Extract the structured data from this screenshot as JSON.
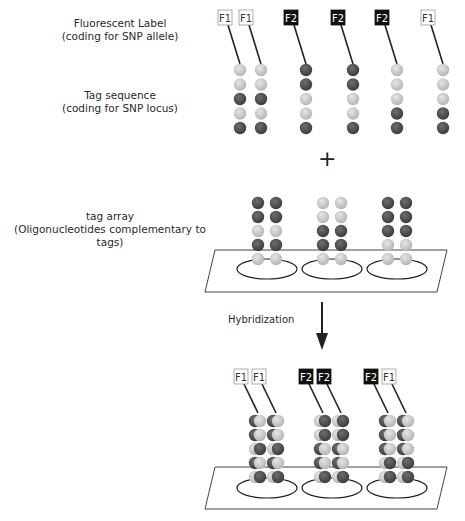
{
  "labels": {
    "fluorescent_label_line1": "Fluorescent Label",
    "fluorescent_label_line2": "(coding for SNP allele)",
    "tag_sequence_line1": "Tag sequence",
    "tag_sequence_line2": "(coding for SNP locus)",
    "tag_array_line1": "tag array",
    "tag_array_line2": "(Oligonucleotides complementary to tags)",
    "plus": "+",
    "hybridization": "Hybridization"
  },
  "colors": {
    "light_bead": "#c8c8c8",
    "dark_bead": "#555555",
    "f1_box_bg": "#ffffff",
    "f1_box_text": "#333333",
    "f2_box_bg": "#111111",
    "f2_box_text": "#ffffff",
    "line": "#222222"
  },
  "probes": [
    {
      "label": "F1",
      "x": 242,
      "beads": [
        "L",
        "L",
        "D",
        "L",
        "D"
      ]
    },
    {
      "label": "F1",
      "x": 263,
      "beads": [
        "L",
        "L",
        "D",
        "L",
        "D"
      ]
    },
    {
      "label": "F2",
      "x": 308,
      "beads": [
        "D",
        "D",
        "L",
        "L",
        "D"
      ]
    },
    {
      "label": "F2",
      "x": 355,
      "beads": [
        "D",
        "D",
        "L",
        "L",
        "D"
      ]
    },
    {
      "label": "F2",
      "x": 399,
      "beads": [
        "L",
        "L",
        "L",
        "D",
        "D"
      ]
    },
    {
      "label": "F1",
      "x": 445,
      "beads": [
        "L",
        "L",
        "L",
        "D",
        "D"
      ]
    }
  ],
  "array_spots": [
    {
      "columns": [
        258,
        276
      ],
      "beads": [
        "D",
        "D",
        "L",
        "D",
        "L"
      ]
    },
    {
      "columns": [
        323,
        341
      ],
      "beads": [
        "L",
        "L",
        "D",
        "D",
        "L"
      ]
    },
    {
      "columns": [
        388,
        406
      ],
      "beads": [
        "D",
        "D",
        "D",
        "L",
        "L"
      ]
    }
  ],
  "hybridized": [
    {
      "labels": [
        "F1",
        "F1"
      ],
      "columns": [
        258,
        276
      ],
      "probe_beads": [
        "L",
        "L",
        "D",
        "L",
        "D"
      ],
      "array_beads": [
        "D",
        "D",
        "L",
        "D",
        "L"
      ]
    },
    {
      "labels": [
        "F2",
        "F2"
      ],
      "columns": [
        323,
        341
      ],
      "probe_beads": [
        "D",
        "D",
        "L",
        "L",
        "D"
      ],
      "array_beads": [
        "L",
        "L",
        "D",
        "D",
        "L"
      ]
    },
    {
      "labels": [
        "F2",
        "F1"
      ],
      "columns": [
        388,
        406
      ],
      "probe_beads": [
        "L",
        "L",
        "L",
        "D",
        "D"
      ],
      "array_beads": [
        "D",
        "D",
        "D",
        "L",
        "L"
      ]
    }
  ]
}
